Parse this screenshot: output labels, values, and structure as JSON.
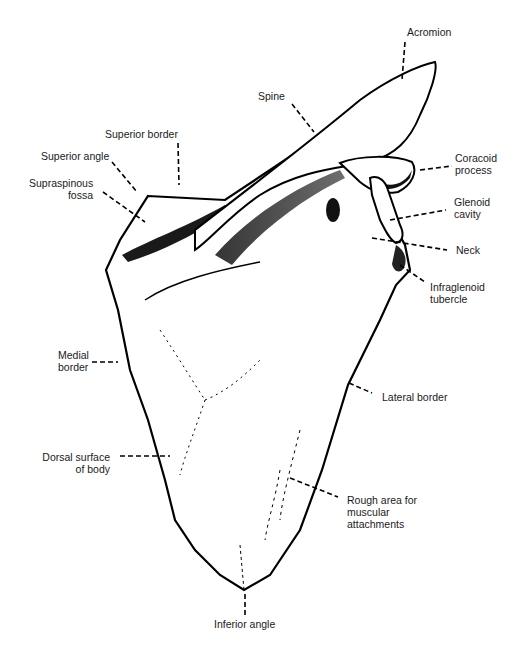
{
  "figure": {
    "labels": {
      "acromion": "Acromion",
      "spine": "Spine",
      "superior_border": "Superior border",
      "superior_angle": "Superior angle",
      "supraspinous_fossa_1": "Supraspinous",
      "supraspinous_fossa_2": "fossa",
      "coracoid_1": "Coracoid",
      "coracoid_2": "process",
      "glenoid_1": "Glenoid",
      "glenoid_2": "cavity",
      "neck": "Neck",
      "infraglenoid_1": "Infraglenoid",
      "infraglenoid_2": "tubercle",
      "medial_border_1": "Medial",
      "medial_border_2": "border",
      "lateral_border": "Lateral border",
      "dorsal_surface_1": "Dorsal surface",
      "dorsal_surface_2": "of body",
      "rough_area_1": "Rough area for",
      "rough_area_2": "muscular",
      "rough_area_3": "attachments",
      "inferior_angle": "Inferior angle"
    }
  }
}
